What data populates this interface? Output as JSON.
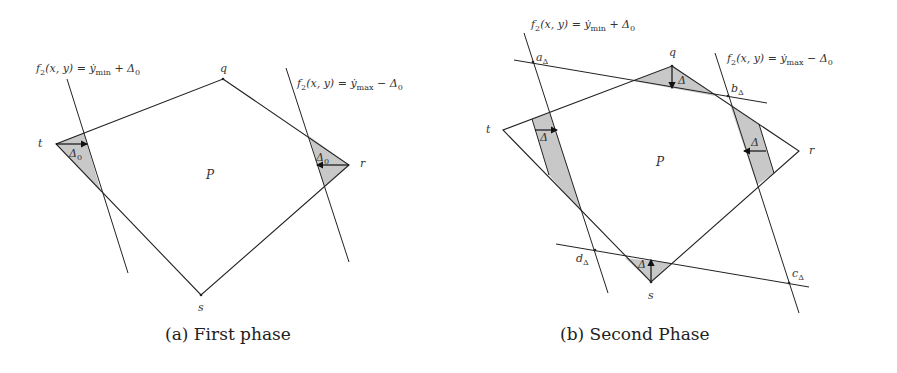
{
  "panels": [
    {
      "id": "a",
      "caption": "(a) First phase",
      "polygon_label": "P",
      "vertices": {
        "q": "q",
        "t": "t",
        "r": "r",
        "s": "s"
      },
      "lines": {
        "min_line": {
          "func": "f",
          "func_sub": "2",
          "args": "(x, y) = ẏ",
          "bound_sub": "min",
          "op": " + Δ",
          "delta_sub": "0"
        },
        "max_line": {
          "func": "f",
          "func_sub": "2",
          "args": "(x, y) = ẏ",
          "bound_sub": "max",
          "op": " − Δ",
          "delta_sub": "0"
        }
      },
      "delta_labels": {
        "left": "Δ",
        "left_sub": "0",
        "right": "Δ",
        "right_sub": "0"
      }
    },
    {
      "id": "b",
      "caption": "(b) Second Phase",
      "polygon_label": "P",
      "vertices": {
        "q": "q",
        "t": "t",
        "r": "r",
        "s": "s"
      },
      "corner_labels": {
        "a": "a",
        "b": "b",
        "c": "c",
        "d": "d",
        "sub": "Δ"
      },
      "lines": {
        "min_line": {
          "func": "f",
          "func_sub": "2",
          "args": "(x, y) = ẏ",
          "bound_sub": "min",
          "op": " + Δ",
          "delta_sub": "0"
        },
        "max_line": {
          "func": "f",
          "func_sub": "2",
          "args": "(x, y) = ẏ",
          "bound_sub": "max",
          "op": " − Δ",
          "delta_sub": "0"
        }
      },
      "delta_labels": {
        "top": "Δ",
        "left": "Δ",
        "right": "Δ",
        "bottom": "Δ"
      }
    }
  ],
  "colors": {
    "stroke": "#222222",
    "shade": "#c8c8c8",
    "background": "#ffffff"
  }
}
